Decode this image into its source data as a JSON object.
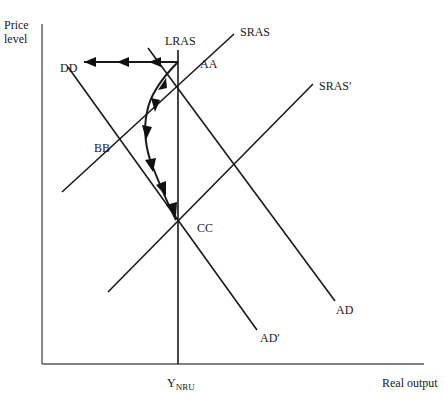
{
  "axes": {
    "y_label_line1": "Price",
    "y_label_line2": "level",
    "x_label": "Real output",
    "x_tick_main": "Y",
    "x_tick_sub": "NRU"
  },
  "curves": {
    "lras": "LRAS",
    "sras": "SRAS",
    "sras_prime": "SRAS′",
    "ad": "AD",
    "ad_prime": "AD′"
  },
  "points": {
    "aa": "AA",
    "bb": "BB",
    "cc": "CC",
    "dd": "DD"
  },
  "colors": {
    "ink": "#1a1a1a",
    "axis": "#555555",
    "background": "#ffffff"
  }
}
